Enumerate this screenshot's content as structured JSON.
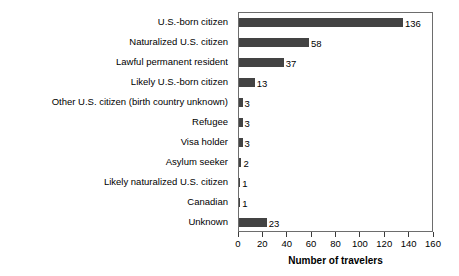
{
  "chart_data": {
    "type": "bar",
    "orientation": "horizontal",
    "title": "",
    "xlabel": "Number of travelers",
    "ylabel": "",
    "xlim": [
      0,
      160
    ],
    "xticks": [
      0,
      20,
      40,
      60,
      80,
      100,
      120,
      140,
      160
    ],
    "grid": false,
    "legend": null,
    "bar_color": "#434343",
    "frame_color": "#6d6d6d",
    "categories": [
      "U.S.-born citizen",
      "Naturalized U.S. citizen",
      "Lawful permanent resident",
      "Likely U.S.-born citizen",
      "Other U.S. citizen (birth country unknown)",
      "Refugee",
      "Visa holder",
      "Asylum seeker",
      "Likely naturalized U.S. citizen",
      "Canadian",
      "Unknown"
    ],
    "values": [
      136,
      58,
      37,
      13,
      3,
      3,
      3,
      2,
      1,
      1,
      23
    ],
    "value_labels": [
      "136",
      "58",
      "37",
      "13",
      "3",
      "3",
      "3",
      "2",
      "1",
      "1",
      "23"
    ]
  }
}
